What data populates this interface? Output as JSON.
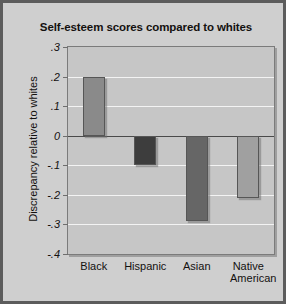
{
  "figure": {
    "faint_header_text": "",
    "frame_color": "#5c5c5c",
    "background_color": "#cfcfcf",
    "plot_background_color": "#c6c6c6",
    "gridline_color": "#f3f3f3",
    "zero_line_color": "#4a4a4a"
  },
  "chart_data": {
    "type": "bar",
    "title": "Self-esteem scores compared to whites",
    "xlabel": "",
    "ylabel": "Discrepancy relative to whites",
    "categories": [
      "Black",
      "Hispanic",
      "Asian",
      "Native American"
    ],
    "category_lines": [
      [
        "Black"
      ],
      [
        "Hispanic"
      ],
      [
        "Asian"
      ],
      [
        "Native",
        "American"
      ]
    ],
    "values": [
      0.2,
      -0.1,
      -0.29,
      -0.21
    ],
    "bar_colors": [
      "#8a8a8a",
      "#3d3d3d",
      "#666666",
      "#a0a0a0"
    ],
    "ylim": [
      -0.4,
      0.3
    ],
    "yticks": [
      0.3,
      0.2,
      0.1,
      0,
      -0.1,
      -0.2,
      -0.3,
      -0.4
    ],
    "ytick_labels": [
      ".3",
      ".2",
      ".1",
      "0",
      "-.1",
      "-.2",
      "-.3",
      "-.4"
    ],
    "grid": true,
    "legend": false,
    "zero_reference": 0
  }
}
